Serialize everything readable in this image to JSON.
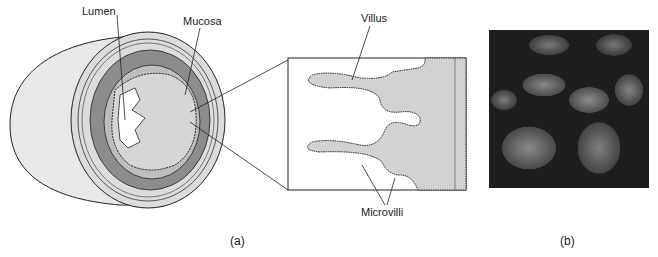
{
  "figure": {
    "panel_a": {
      "caption": "(a)",
      "labels": {
        "lumen": "Lumen",
        "mucosa": "Mucosa",
        "villus": "Villus",
        "microvilli": "Microvilli"
      }
    },
    "panel_b": {
      "caption": "(b)",
      "image_description": "Scanning electron micrograph of intestinal villi"
    }
  },
  "colors": {
    "outer_stipple": "#e6e6e6",
    "muscle_layer": "#8c8c8c",
    "mucosa_fill": "#d0d0d0",
    "lumen": "#ffffff",
    "outline": "#222222"
  }
}
